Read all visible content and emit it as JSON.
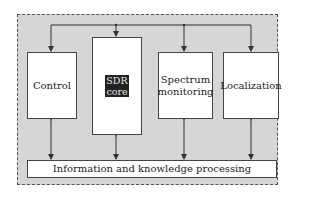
{
  "diagram": {
    "nodes": [
      {
        "id": "control",
        "label": "Control"
      },
      {
        "id": "sdr",
        "label_line1": "SDR",
        "label_line2": "core"
      },
      {
        "id": "spectrum",
        "label_line1": "Spectrum",
        "label_line2": "monitoring"
      },
      {
        "id": "localization",
        "label": "Localization"
      },
      {
        "id": "info",
        "label": "Information and knowledge processing"
      }
    ],
    "edges": [
      {
        "from": "top-bus",
        "to": "control",
        "type": "arrow"
      },
      {
        "from": "top-bus",
        "to": "sdr",
        "type": "arrow"
      },
      {
        "from": "top-bus",
        "to": "spectrum",
        "type": "arrow"
      },
      {
        "from": "top-bus",
        "to": "localization",
        "type": "arrow"
      },
      {
        "from": "control",
        "to": "info",
        "type": "bidirectional"
      },
      {
        "from": "sdr",
        "to": "info",
        "type": "bidirectional"
      },
      {
        "from": "spectrum",
        "to": "info",
        "type": "bidirectional"
      },
      {
        "from": "localization",
        "to": "info",
        "type": "bidirectional"
      }
    ],
    "colors": {
      "frame_fill": "#d6d6d6",
      "frame_border": "#555555",
      "box_fill": "#ffffff",
      "line": "#333333",
      "sdr_label_bg": "#222222"
    }
  }
}
